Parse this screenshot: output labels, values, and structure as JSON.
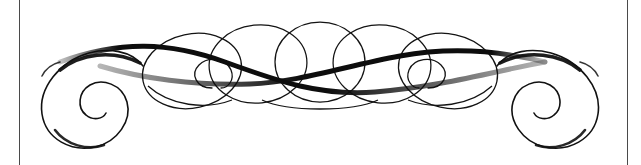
{
  "canvas": {
    "width": 641,
    "height": 165,
    "background_color": "#ffffff",
    "title": "Decorative calligraphic flourish ornament"
  },
  "borders": {
    "stroke_color": "#4a4a4a",
    "stroke_width": 1,
    "left": {
      "x": 19,
      "y1": 0,
      "y2": 165
    },
    "right": {
      "x": 627,
      "y1": 0,
      "y2": 165
    }
  },
  "artwork": {
    "name": "flourish-ornament",
    "ink_color": "#0d0d0d",
    "description": "Horizontally symmetric pen flourish: large inward spiral at each end, a chain of overlapping tilted elliptical loops across the middle, and two heavy sweeping S-curve strokes crossing at center.",
    "bounds": {
      "x": 38,
      "y": 24,
      "width": 545,
      "height": 125
    },
    "symmetry": "mirror-horizontal",
    "center_x": 320,
    "strokes": {
      "spiral_left": {
        "name": "left-end-spiral",
        "direction": "counterclockwise-inward",
        "center": {
          "x": 90,
          "y": 101
        },
        "outer_radius": 48,
        "turns": 1.8,
        "path": "M 143 66 C 131 50 108 48 89 53 C 60 61 38 88 42 114 C 46 140 72 152 95 147 C 118 142 132 120 127 102 C 122 84 102 78 90 85 C 78 92 77 108 86 115 C 93 121 103 119 106 113"
      },
      "spiral_right": {
        "name": "right-end-spiral",
        "direction": "clockwise-inward",
        "center": {
          "x": 550,
          "y": 101
        },
        "outer_radius": 48,
        "turns": 1.8,
        "path": "M 497 66 C 509 50 532 48 551 53 C 580 61 602 88 598 114 C 594 140 568 152 545 147 C 522 142 508 120 513 102 C 518 84 538 78 550 85 C 562 92 563 108 554 115 C 547 121 537 119 534 113"
      },
      "loops": [
        {
          "name": "loop-1",
          "cx": 192,
          "cy": 71,
          "rx": 50,
          "ry": 37,
          "rotate": -12
        },
        {
          "name": "loop-2",
          "cx": 258,
          "cy": 64,
          "rx": 49,
          "ry": 39,
          "rotate": -6
        },
        {
          "name": "loop-3",
          "cx": 320,
          "cy": 62,
          "rx": 45,
          "ry": 40,
          "rotate": 0
        },
        {
          "name": "loop-4",
          "cx": 382,
          "cy": 64,
          "rx": 49,
          "ry": 39,
          "rotate": 6
        },
        {
          "name": "loop-5",
          "cx": 448,
          "cy": 71,
          "rx": 50,
          "ry": 37,
          "rotate": 12
        }
      ],
      "inner_curls": [
        {
          "name": "inner-curl-left",
          "path": "M 212 88 C 196 88 190 74 199 65 C 208 56 226 58 231 70 C 235 80 228 88 221 88"
        },
        {
          "name": "inner-curl-right",
          "path": "M 428 88 C 444 88 450 74 441 65 C 432 56 414 58 409 70 C 405 80 412 88 419 88"
        }
      ],
      "sweeps": [
        {
          "name": "sweep-upper",
          "weight": "heavy",
          "max_width": 5,
          "path": "M 60 62 C 120 40 170 42 225 62 C 280 82 320 96 375 92 C 440 87 500 70 545 62"
        },
        {
          "name": "sweep-lower",
          "weight": "heavy",
          "max_width": 5,
          "path": "M 545 62 C 505 52 455 46 400 56 C 345 66 300 82 250 84 C 195 86 140 78 100 66"
        }
      ]
    }
  }
}
